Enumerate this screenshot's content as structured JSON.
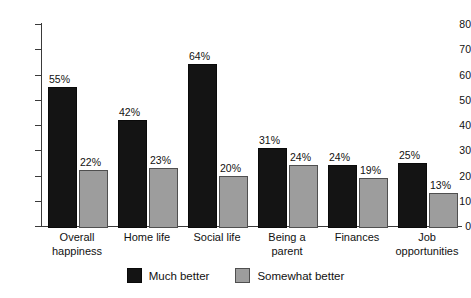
{
  "chart_data": {
    "type": "bar",
    "title": "",
    "subtitle": "",
    "xlabel": "",
    "ylabel": "",
    "ylim": [
      0,
      80
    ],
    "yticks": [
      0,
      10,
      20,
      30,
      40,
      50,
      60,
      70,
      80
    ],
    "ytick_labels": [
      "0",
      "10",
      "20",
      "30",
      "40",
      "50",
      "60",
      "70",
      "80"
    ],
    "grid": false,
    "legend_position": "bottom-center",
    "categories": [
      "Overall happiness",
      "Home life",
      "Social life",
      "Being a parent",
      "Finances",
      "Job opportunities"
    ],
    "category_lines": [
      [
        "Overall",
        "happiness"
      ],
      [
        "Home life",
        ""
      ],
      [
        "Social life",
        ""
      ],
      [
        "Being a",
        "parent"
      ],
      [
        "Finances",
        ""
      ],
      [
        "Job",
        "opportunities"
      ]
    ],
    "series": [
      {
        "name": "Much better",
        "color": "#141414",
        "values": [
          55,
          42,
          64,
          31,
          24,
          25
        ],
        "labels": [
          "55%",
          "42%",
          "64%",
          "31%",
          "24%",
          "25%"
        ]
      },
      {
        "name": "Somewhat better",
        "color": "#9d9d9d",
        "values": [
          22,
          23,
          20,
          24,
          19,
          13
        ],
        "labels": [
          "22%",
          "23%",
          "20%",
          "24%",
          "19%",
          "13%"
        ]
      }
    ]
  },
  "legend": {
    "items": [
      {
        "label": "Much better",
        "swatch": "dark"
      },
      {
        "label": "Somewhat better",
        "swatch": "light"
      }
    ]
  }
}
